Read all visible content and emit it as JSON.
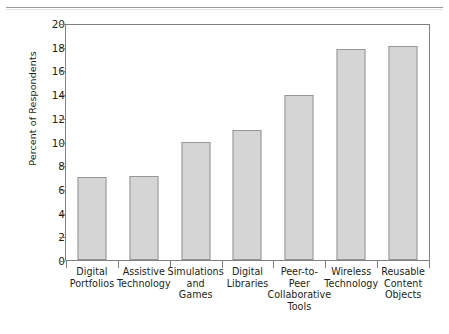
{
  "figure": {
    "top_rule": "horizontal-rule",
    "axis_color": "#808080",
    "bar_fill": "#d5d5d5",
    "bar_border": "#969696"
  },
  "chart_data": {
    "type": "bar",
    "title": "",
    "xlabel": "",
    "ylabel": "Percent of Respondents",
    "categories": [
      "Digital Portfolios",
      "Assistive Technology",
      "Simulations and Games",
      "Digital Libraries",
      "Peer-to-Peer Collaborative Tools",
      "Wireless Technology",
      "Reusable Content Objects"
    ],
    "category_lines": [
      [
        "Digital",
        "Portfolios"
      ],
      [
        "Assistive",
        "Technology"
      ],
      [
        "Simulations",
        "and",
        "Games"
      ],
      [
        "Digital",
        "Libraries"
      ],
      [
        "Peer-to-",
        "Peer",
        "Collaborative",
        "Tools"
      ],
      [
        "Wireless",
        "Technology"
      ],
      [
        "Reusable",
        "Content",
        "Objects"
      ]
    ],
    "values": [
      7.0,
      7.1,
      10.0,
      11.0,
      13.9,
      17.8,
      18.1
    ],
    "ylim": [
      0,
      20
    ],
    "ytick_step": 2,
    "yticks": [
      0,
      2,
      4,
      6,
      8,
      10,
      12,
      14,
      16,
      18,
      20
    ],
    "ytick_labels": [
      "0",
      "2",
      "4",
      "6",
      "8",
      "10",
      "12",
      "14",
      "16",
      "18",
      "20"
    ],
    "grid": false,
    "legend": null
  }
}
